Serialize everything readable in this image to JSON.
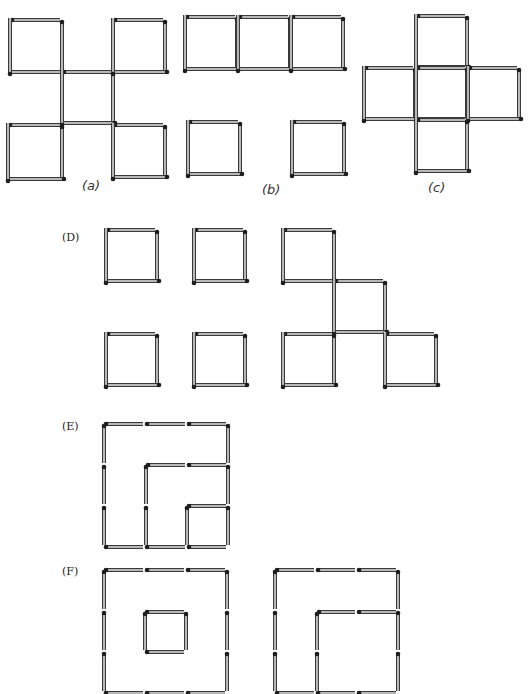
{
  "figure": {
    "colors": {
      "match_body": "#b8b8b8",
      "match_outline": "#3a3a3a",
      "match_head": "#1e1e1e",
      "label": "#333333",
      "background": "#ffffff"
    }
  },
  "panels": [
    {
      "id": "a",
      "label": "(a)",
      "label_pos": [
        82,
        190
      ],
      "label_style": "italic",
      "description": "Four corner squares connected by a central square formed from shared edges",
      "squares": [
        [
          10,
          20,
          52
        ],
        [
          113,
          20,
          52
        ],
        [
          62,
          72,
          51
        ],
        [
          8,
          125,
          54
        ],
        [
          113,
          125,
          52
        ]
      ]
    },
    {
      "id": "b",
      "label": "(b)",
      "label_pos": [
        262,
        194
      ],
      "label_style": "italic",
      "description": "Row of three squares above two separate squares",
      "squares": [
        [
          185,
          17,
          52
        ],
        [
          238,
          17,
          52
        ],
        [
          291,
          17,
          52
        ],
        [
          188,
          122,
          52
        ],
        [
          292,
          122,
          52
        ]
      ]
    },
    {
      "id": "c",
      "label": "(c)",
      "label_pos": [
        428,
        192
      ],
      "label_style": "italic",
      "description": "Cross of five squares",
      "squares": [
        [
          416,
          16,
          51
        ],
        [
          364,
          68,
          51
        ],
        [
          416,
          68,
          51
        ],
        [
          468,
          68,
          51
        ],
        [
          416,
          120,
          51
        ]
      ]
    },
    {
      "id": "D",
      "label": "(D)",
      "label_pos": [
        62,
        241
      ],
      "label_style": "roman",
      "description": "Four separate squares and a staircase of four squares",
      "squares": [
        [
          106,
          230,
          51
        ],
        [
          194,
          230,
          51
        ],
        [
          106,
          334,
          51
        ],
        [
          194,
          334,
          51
        ],
        [
          283,
          230,
          51
        ],
        [
          334,
          281,
          51
        ],
        [
          283,
          334,
          51
        ],
        [
          385,
          334,
          51
        ]
      ]
    },
    {
      "id": "E",
      "label": "(E)",
      "label_pos": [
        62,
        430
      ],
      "label_style": "roman",
      "description": "Nested squares sharing the bottom-right corner (3x3, 2x2, 1x1)",
      "segments": [
        [
          104,
          424,
          145,
          424
        ],
        [
          145,
          424,
          187,
          424
        ],
        [
          187,
          424,
          228,
          424
        ],
        [
          104,
          424,
          104,
          465
        ],
        [
          104,
          465,
          104,
          506
        ],
        [
          104,
          506,
          104,
          547
        ],
        [
          228,
          424,
          228,
          465
        ],
        [
          228,
          465,
          228,
          506
        ],
        [
          228,
          506,
          228,
          547
        ],
        [
          104,
          547,
          145,
          547
        ],
        [
          145,
          547,
          187,
          547
        ],
        [
          187,
          547,
          228,
          547
        ],
        [
          146,
          465,
          187,
          465
        ],
        [
          187,
          465,
          228,
          465
        ],
        [
          146,
          465,
          146,
          506
        ],
        [
          146,
          506,
          146,
          547
        ],
        [
          187,
          506,
          228,
          506
        ],
        [
          187,
          506,
          187,
          547
        ]
      ]
    },
    {
      "id": "F",
      "label": "(F)",
      "label_pos": [
        62,
        575
      ],
      "label_style": "roman",
      "description": "Large 3x3 square with small centered square; second figure large square with inner 2x2 square at bottom-right",
      "segments": [
        [
          104,
          570,
          145,
          570
        ],
        [
          145,
          570,
          186,
          570
        ],
        [
          186,
          570,
          227,
          570
        ],
        [
          104,
          570,
          104,
          611
        ],
        [
          104,
          611,
          104,
          652
        ],
        [
          104,
          652,
          104,
          693
        ],
        [
          227,
          570,
          227,
          611
        ],
        [
          227,
          611,
          227,
          652
        ],
        [
          227,
          652,
          227,
          693
        ],
        [
          104,
          693,
          145,
          693
        ],
        [
          145,
          693,
          186,
          693
        ],
        [
          186,
          693,
          227,
          693
        ],
        [
          145,
          612,
          186,
          612
        ],
        [
          145,
          612,
          145,
          652
        ],
        [
          186,
          612,
          186,
          652
        ],
        [
          145,
          652,
          186,
          652
        ],
        [
          275,
          570,
          316,
          570
        ],
        [
          316,
          570,
          357,
          570
        ],
        [
          357,
          570,
          398,
          570
        ],
        [
          275,
          570,
          275,
          611
        ],
        [
          275,
          611,
          275,
          652
        ],
        [
          275,
          652,
          275,
          693
        ],
        [
          398,
          570,
          398,
          611
        ],
        [
          398,
          611,
          398,
          652
        ],
        [
          398,
          652,
          398,
          693
        ],
        [
          275,
          693,
          316,
          693
        ],
        [
          316,
          693,
          357,
          693
        ],
        [
          357,
          693,
          398,
          693
        ],
        [
          317,
          612,
          357,
          612
        ],
        [
          357,
          612,
          398,
          612
        ],
        [
          317,
          612,
          317,
          652
        ],
        [
          317,
          652,
          317,
          693
        ]
      ]
    }
  ]
}
